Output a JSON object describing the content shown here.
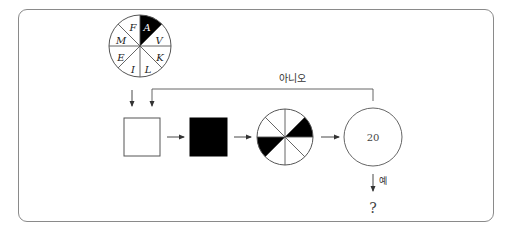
{
  "diagram": {
    "type": "flowchart",
    "colors": {
      "stroke": "#555555",
      "fill_black": "#000000",
      "frame": "#8a8a8a"
    },
    "letter_wheel": {
      "slices_clockwise_from_top": [
        "A",
        "V",
        "K",
        "L",
        "I",
        "E",
        "M",
        "F"
      ],
      "highlighted": "A"
    },
    "steps": [
      {
        "id": "input-square",
        "shape": "square",
        "fill": "white"
      },
      {
        "id": "filled-square",
        "shape": "square",
        "fill": "black"
      },
      {
        "id": "pie-wheel",
        "shape": "circle-8-slices",
        "filled_slices": [
          1,
          4
        ]
      },
      {
        "id": "count-circle",
        "shape": "circle",
        "label": "20"
      }
    ],
    "loop_label": "아니오",
    "yes_label": "예",
    "result_label": "?"
  }
}
